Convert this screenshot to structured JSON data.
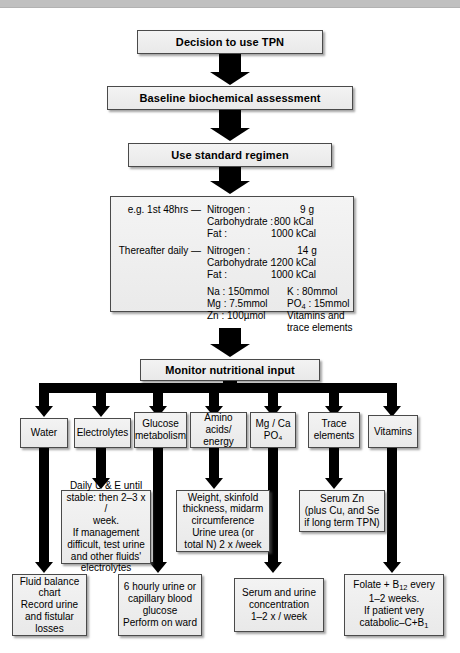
{
  "meta": {
    "accent_color": "#000000",
    "box_fill": "#eeeeee",
    "box_border": "#4a4a4a",
    "topbar_color": "#c0c0c0"
  },
  "spine": {
    "step1": "Decision to use TPN",
    "step2": "Baseline biochemical assessment",
    "step3": "Use standard regimen",
    "step4": "Monitor nutritional input"
  },
  "regimen": {
    "first_label": "e.g. 1st 48hrs —",
    "first_rows": [
      {
        "name": "Nitrogen :",
        "value": "9 g"
      },
      {
        "name": "Carbohydrate :",
        "value": "800 kCal"
      },
      {
        "name": "Fat :",
        "value": "1000 kCal"
      }
    ],
    "thereafter_label": "Thereafter daily —",
    "thereafter_rows": [
      {
        "name": "Nitrogen :",
        "value": "14 g"
      },
      {
        "name": "Carbohydrate :",
        "value": "1200 kCal"
      },
      {
        "name": "Fat :",
        "value": "1000 kCal"
      }
    ],
    "minerals_left": [
      "Na : 150mmol",
      "Mg : 7.5mmol",
      "Zn : 100µmol"
    ],
    "minerals_right_1": "K : 80mmol",
    "minerals_right_2_pre": "PO",
    "minerals_right_2_sub": "4",
    "minerals_right_2_post": " : 15mmol",
    "minerals_right_3": "Vitamins and",
    "minerals_right_4": "trace elements"
  },
  "categories": [
    {
      "id": "water",
      "label": "Water"
    },
    {
      "id": "electrolytes",
      "label": "Electrolytes"
    },
    {
      "id": "glucose",
      "label": "Glucose\nmetabolism"
    },
    {
      "id": "amino-acids",
      "label": "Amino acids/\nenergy"
    },
    {
      "id": "mg-ca-po4",
      "label": "Mg / Ca\nPO₄"
    },
    {
      "id": "trace",
      "label": "Trace\nelements"
    },
    {
      "id": "vitamins",
      "label": "Vitamins"
    }
  ],
  "mid_details": [
    {
      "id": "electrolytes-mid",
      "text": "Daily U & E until\nstable: then 2–3 x /\nweek.\nIf management\ndifficult, test urine\nand other fluids'\nelectrolytes"
    },
    {
      "id": "amino-acids-mid",
      "text": "Weight, skinfold\nthickness, midarm\ncircumference\nUrine urea (or\ntotal N) 2 x /week"
    },
    {
      "id": "trace-mid",
      "text": "Serum Zn\n(plus Cu, and Se\nif long term TPN)"
    }
  ],
  "bottom_details": [
    {
      "id": "water-bottom",
      "text": "Fluid balance\nchart\nRecord urine\nand fistular\nlosses"
    },
    {
      "id": "glucose-bottom",
      "text": "6 hourly urine or\ncapillary blood\nglucose\nPerform on ward"
    },
    {
      "id": "mg-ca-bottom",
      "text": "Serum and urine\nconcentration\n1–2 x / week"
    },
    {
      "id": "vitamins-bottom",
      "line1_pre": "Folate + B",
      "line1_sub": "12",
      "line1_post": " every",
      "line2": "1–2 weeks.",
      "line3": "If patient very",
      "line4_pre": "catabolic–C+B",
      "line4_sub": "1"
    }
  ]
}
